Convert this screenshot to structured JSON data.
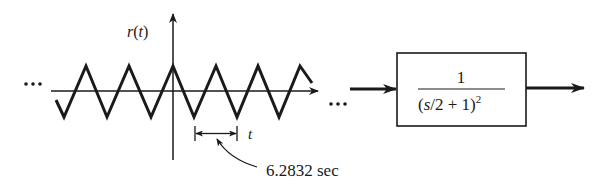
{
  "signal": {
    "label": "r(t)",
    "label_func": "r",
    "label_arg": "t",
    "waveform": "triangle",
    "period_label": "6.2832 sec",
    "time_axis_label": "t",
    "ellipsis_left": "...",
    "ellipsis_right": "..."
  },
  "block": {
    "numerator": "1",
    "denominator_main": "(s/2 + 1)",
    "denominator_exponent": "2"
  },
  "colors": {
    "ink": "#1a1a1a",
    "background": "#ffffff"
  }
}
